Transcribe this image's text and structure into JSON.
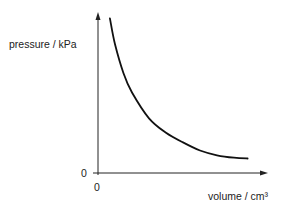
{
  "chart_data": {
    "type": "line",
    "title": "",
    "xlabel": "volume / cm³",
    "ylabel": "pressure / kPa",
    "x_origin_label": "0",
    "y_origin_label": "0",
    "xlim": [
      0,
      1
    ],
    "ylim": [
      0,
      1
    ],
    "grid": false,
    "legend": "none",
    "series": [
      {
        "name": "pressure vs volume (inverse relationship)",
        "x": [
          0.07,
          0.1,
          0.15,
          0.2,
          0.3,
          0.4,
          0.5,
          0.6,
          0.7,
          0.8,
          0.88
        ],
        "y": [
          0.96,
          0.8,
          0.62,
          0.5,
          0.34,
          0.25,
          0.19,
          0.14,
          0.11,
          0.095,
          0.09
        ]
      }
    ],
    "colors": {
      "axis": "#222222",
      "curve": "#111111",
      "text": "#222222"
    }
  }
}
